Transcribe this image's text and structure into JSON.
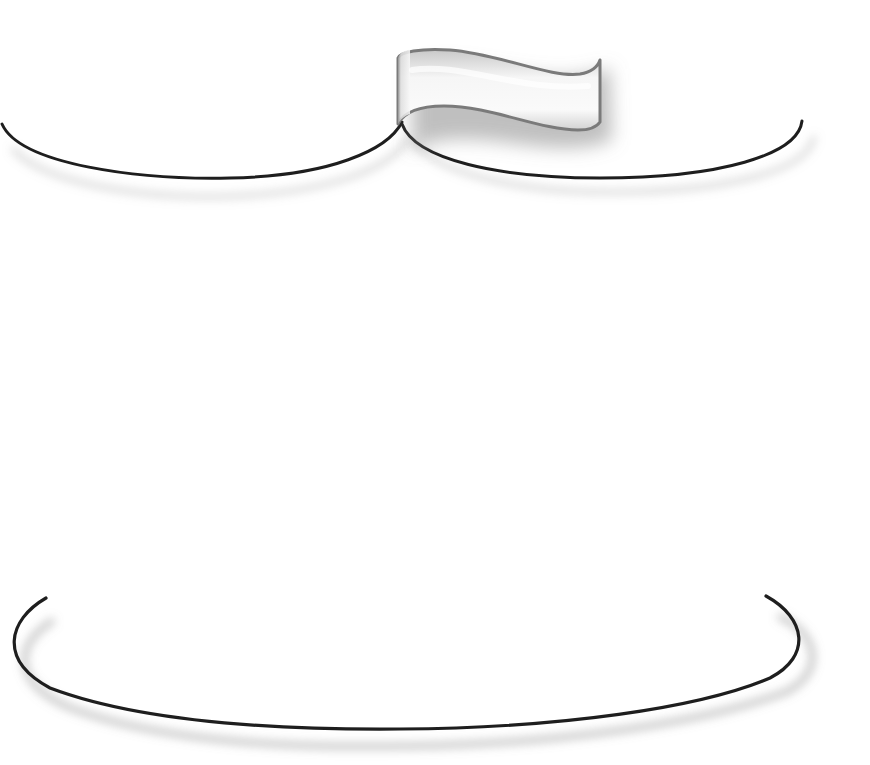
{
  "illustration": {
    "description": "Decorative frame with curled ribbon banner",
    "background": "#ffffff",
    "stroke_color": "#1e1e1e",
    "ribbon_fill_light": "#f4f4f4",
    "ribbon_fill_dark": "#c4c4c4",
    "ribbon_outline": "#7a7a7a",
    "shadow_color": "#9a9a9a",
    "ribbon_label": ""
  }
}
